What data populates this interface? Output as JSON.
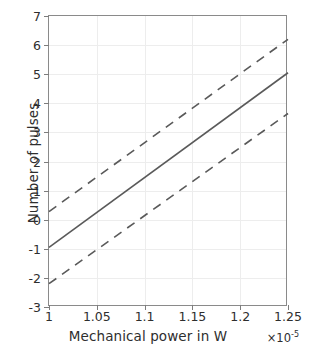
{
  "chart_data": {
    "type": "line",
    "title": "",
    "xlabel": "Mechanical power in W",
    "ylabel": "Number of pulses",
    "x_multiplier": "×10",
    "x_multiplier_exponent": "-5",
    "xlim": [
      1,
      1.25
    ],
    "ylim": [
      -3,
      7
    ],
    "xticks": [
      1,
      1.05,
      1.1,
      1.15,
      1.2,
      1.25
    ],
    "xticklabels": [
      "1",
      "1.05",
      "1.1",
      "1.15",
      "1.2",
      "1.25"
    ],
    "yticks": [
      -3,
      -2,
      -1,
      0,
      1,
      2,
      3,
      4,
      5,
      6,
      7
    ],
    "yticklabels": [
      "-3",
      "-2",
      "-1",
      "0",
      "1",
      "2",
      "3",
      "4",
      "5",
      "6",
      "7"
    ],
    "grid": true,
    "legend": null,
    "series": [
      {
        "name": "fit",
        "style": "solid",
        "color": "#5a5a5a",
        "x": [
          1,
          1.25
        ],
        "values": [
          -0.95,
          5.05
        ]
      },
      {
        "name": "upper-confidence-bound",
        "style": "dashed",
        "color": "#5a5a5a",
        "x": [
          1,
          1.25
        ],
        "values": [
          0.28,
          6.2
        ]
      },
      {
        "name": "lower-confidence-bound",
        "style": "dashed",
        "color": "#5a5a5a",
        "x": [
          1,
          1.25
        ],
        "values": [
          -2.2,
          3.65
        ]
      }
    ]
  },
  "colors": {
    "axis": "#8a8a8a",
    "grid": "#ededed",
    "text": "#2e2e2e",
    "line": "#5a5a5a",
    "background": "#ffffff"
  }
}
